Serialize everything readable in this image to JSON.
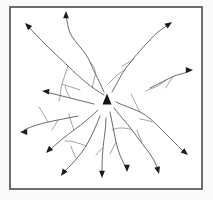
{
  "figure": {
    "background_color": "#ffffff",
    "frame_color": "#4a4a4a",
    "line_color": "#3a3a3a",
    "branch_color": "#6a6a6a",
    "arrow_color": "#1c1c1c",
    "center_marker": {
      "name": "center-triangle",
      "shape": "filled-triangle",
      "color": "#141414",
      "x": 107,
      "y": 99,
      "width": 9,
      "height": 11
    },
    "frame": {
      "x": 10,
      "y": 7,
      "width": 192,
      "height": 182,
      "stroke_width": 1.6
    },
    "arrow_count": 12,
    "arrows": [
      {
        "name": "arrow-northwest-far",
        "direction": "northwest",
        "bearing_deg": 315,
        "path": "M104,95 C92,88 80,78 68,66 C62,60 55,54 46,45 C40,39 34,33 28,26",
        "head": {
          "x": 25,
          "y": 23,
          "angle_deg": 225
        },
        "branches": [
          "M68,66 C66,72 64,78 62,84 C60,90 61,96 59,101",
          "M62,84 C68,86 74,88 80,90"
        ]
      },
      {
        "name": "arrow-north",
        "direction": "north",
        "bearing_deg": 0,
        "path": "M104,92 C100,82 94,72 90,62 C86,52 76,44 70,33 C68,28 67,22 66,14",
        "head": {
          "x": 66,
          "y": 11,
          "angle_deg": 270
        },
        "branches": [
          "M90,62 C94,66 96,70 95,76 C94,80 93,84 92,88"
        ]
      },
      {
        "name": "arrow-north-northeast",
        "direction": "north-northeast",
        "bearing_deg": 25,
        "path": "M112,92 C117,84 120,76 126,68 C132,60 140,50 150,40 C155,34 160,30 168,25",
        "head": {
          "x": 172,
          "y": 22,
          "angle_deg": 325
        },
        "branches": [
          "M126,68 C122,72 118,74 114,78 C112,80 110,82 108,84",
          "M134,59 C130,62 126,64 122,66"
        ]
      },
      {
        "name": "arrow-east-northeast",
        "direction": "east-northeast",
        "bearing_deg": 75,
        "path": "M150,88 C158,84 166,80 174,76 C180,74 186,73 190,71",
        "head": {
          "x": 193,
          "y": 70,
          "angle_deg": 0
        },
        "branches": [
          "M166,80 C162,84 158,86 153,88 C150,89 148,90 146,91",
          "M174,76 C170,80 168,84 166,88"
        ]
      },
      {
        "name": "arrow-east-southeast",
        "direction": "east-southeast",
        "bearing_deg": 110,
        "path": "M116,102 C124,106 132,108 140,112 C148,116 154,122 162,130 C170,138 176,144 184,152",
        "head": {
          "x": 188,
          "y": 155,
          "angle_deg": 40
        },
        "branches": [
          "M140,112 C138,108 136,104 134,100 C133,98 132,96 131,94",
          "M152,122 C148,120 144,120 140,119"
        ]
      },
      {
        "name": "arrow-southeast",
        "direction": "southeast",
        "bearing_deg": 135,
        "path": "M114,108 C120,116 126,122 132,130 C138,138 144,146 150,154 C154,160 156,164 158,170",
        "head": {
          "x": 159,
          "y": 174,
          "angle_deg": 75
        },
        "branches": [
          "M132,130 C128,128 124,128 120,128 C117,128 114,129 112,130",
          "M142,142 C140,138 138,134 137,130"
        ]
      },
      {
        "name": "arrow-south-southeast",
        "direction": "south-southeast",
        "bearing_deg": 160,
        "path": "M110,112 C112,122 114,132 116,142 C118,152 122,160 126,168",
        "head": {
          "x": 127,
          "y": 172,
          "angle_deg": 90
        },
        "branches": [
          "M116,142 C114,146 112,150 110,154"
        ]
      },
      {
        "name": "arrow-south",
        "direction": "south",
        "bearing_deg": 180,
        "path": "M106,118 C106,128 104,138 103,148 C102,158 102,166 102,174",
        "head": {
          "x": 102,
          "y": 178,
          "angle_deg": 90
        },
        "branches": [
          "M103,148 C100,150 98,152 96,155"
        ]
      },
      {
        "name": "arrow-south-southwest",
        "direction": "south-southwest",
        "bearing_deg": 200,
        "path": "M100,116 C96,126 92,136 86,146 C80,156 72,164 64,172",
        "head": {
          "x": 61,
          "y": 176,
          "angle_deg": 125
        },
        "branches": [
          "M86,146 C82,144 78,143 74,142 C71,141 68,141 65,141",
          "M76,158 C74,154 72,150 71,146"
        ]
      },
      {
        "name": "arrow-southwest",
        "direction": "southwest",
        "bearing_deg": 225,
        "path": "M98,110 C90,118 82,124 74,130 C66,136 58,142 50,150",
        "head": {
          "x": 46,
          "y": 153,
          "angle_deg": 135
        },
        "branches": [
          "M74,130 C72,124 70,120 69,114"
        ]
      },
      {
        "name": "arrow-west",
        "direction": "west",
        "bearing_deg": 270,
        "path": "M78,116 C68,118 58,120 48,122 C40,124 32,126 24,130",
        "head": {
          "x": 20,
          "y": 132,
          "angle_deg": 180
        },
        "branches": [
          "M48,122 C46,118 44,115 42,112 C41,110 40,108 39,107",
          "M58,120 C56,124 54,127 52,130"
        ]
      },
      {
        "name": "arrow-west-northwest",
        "direction": "west-northwest",
        "bearing_deg": 292,
        "path": "M94,104 C86,102 78,100 70,98 C62,96 54,94 46,92",
        "head": {
          "x": 42,
          "y": 91,
          "angle_deg": 185
        },
        "branches": [
          "M70,98 C68,94 66,90 65,86"
        ]
      }
    ]
  }
}
